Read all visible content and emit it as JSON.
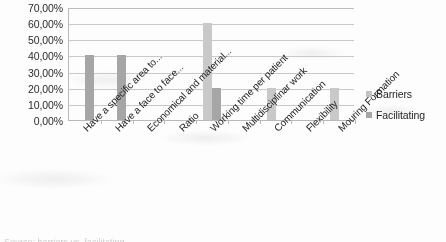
{
  "chart_data": {
    "type": "bar",
    "title": "",
    "subtitle": "",
    "xlabel": "",
    "ylabel": "",
    "ylim": [
      0,
      70
    ],
    "ytick_labels": [
      "70,00%",
      "60,00%",
      "50,00%",
      "40,00%",
      "30,00%",
      "20,00%",
      "10,00%",
      "0,00%"
    ],
    "ytick_values": [
      70,
      60,
      50,
      40,
      30,
      20,
      10,
      0
    ],
    "grid": true,
    "legend_position": "right",
    "categories": [
      "Have a specific area to...",
      "Have a face to face...",
      "Economical and material...",
      "Ratio",
      "Working time per patient",
      "Multidisciplinar work",
      "Communication",
      "Flexibility",
      "Mouring Formation"
    ],
    "series": [
      {
        "name": "Barriers",
        "color": "#c9c9c9",
        "values": [
          0,
          0,
          0,
          0,
          60,
          0,
          20,
          0,
          20
        ]
      },
      {
        "name": "Facilitating",
        "color": "#a6a6a6",
        "values": [
          40,
          40,
          0,
          0,
          20,
          0,
          0,
          0,
          0
        ]
      }
    ]
  },
  "legend": {
    "items": [
      {
        "label": "Barriers"
      },
      {
        "label": "Facilitating"
      }
    ]
  },
  "caption": {
    "text": "Source: barriers vs. facilitating"
  }
}
